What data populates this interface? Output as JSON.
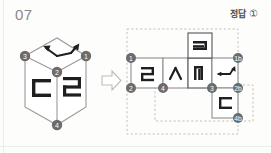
{
  "header": {
    "problem_number": "07",
    "answer_label": "정답",
    "answer_choice": "①"
  },
  "transform_arrow": {
    "icon": "right-arrow-outline-icon",
    "direction": "right"
  },
  "cube": {
    "caption": "cube-isometric-view",
    "faces": [
      {
        "position": "top",
        "symbol": "↖↘↗",
        "symbol_name": "double-bent-arrow",
        "rotation": 0
      },
      {
        "position": "left",
        "symbol": "ㄷ",
        "symbol_name": "hangul-jamo-digeut",
        "rotation": 0
      },
      {
        "position": "right",
        "symbol": "ㄹ",
        "symbol_name": "hangul-jamo-rieul",
        "rotation": 0
      }
    ],
    "vertices": [
      {
        "id": "1",
        "label": "①",
        "x": 86,
        "y": 56
      },
      {
        "id": "2",
        "label": "②",
        "x": 57,
        "y": 72
      },
      {
        "id": "3",
        "label": "③",
        "x": 25,
        "y": 56
      },
      {
        "id": "4",
        "label": "④",
        "x": 57,
        "y": 125
      }
    ]
  },
  "net": {
    "caption": "unfolded-cube-net",
    "cells": [
      {
        "id": "cell-a",
        "symbol": "ㄹ",
        "symbol_name": "hangul-jamo-rieul",
        "col": 0,
        "row": 1
      },
      {
        "id": "cell-b",
        "symbol": "ㅅ",
        "symbol_name": "hangul-jamo-siot",
        "col": 1,
        "row": 1
      },
      {
        "id": "cell-c",
        "symbol": "ㅋ",
        "symbol_name": "hangul-jamo-kieuk",
        "col": 2,
        "row": 0
      },
      {
        "id": "cell-d",
        "symbol": "ㅋ",
        "symbol_name": "hangul-jamo-kieuk-rotated",
        "col": 2,
        "row": 1
      },
      {
        "id": "cell-e",
        "symbol": "↔↗",
        "symbol_name": "double-bent-arrow",
        "col": 3,
        "row": 1
      },
      {
        "id": "cell-f",
        "symbol": "ㄷ",
        "symbol_name": "hangul-jamo-digeut",
        "col": 3,
        "row": 2
      }
    ],
    "vertices": [
      {
        "id": "1",
        "label": "①",
        "x": 131,
        "y": 58
      },
      {
        "id": "2",
        "label": "②",
        "x": 131,
        "y": 88
      },
      {
        "id": "4",
        "label": "④",
        "x": 163,
        "y": 88
      },
      {
        "id": "3",
        "label": "③",
        "x": 212,
        "y": 88
      },
      {
        "id": "2b",
        "label": "②",
        "x": 238,
        "y": 88
      },
      {
        "id": "1b",
        "label": "①",
        "x": 238,
        "y": 58
      },
      {
        "id": "4b",
        "label": "④",
        "x": 238,
        "y": 118
      }
    ],
    "guide_boxes": [
      {
        "id": "guide-outer",
        "x": 127,
        "y": 29,
        "w": 111,
        "h": 105
      },
      {
        "id": "guide-inner",
        "x": 155,
        "y": 85,
        "w": 98,
        "h": 36
      }
    ]
  },
  "colors": {
    "line": "#4d4d4d",
    "line_light": "#9a9a9a",
    "vertex_fill": "#6b6b6b",
    "vertex_text": "#ffffff",
    "guide_dash": "#c4b8b0",
    "text": "#4b4b4b",
    "problem_number": "#8a8a8a",
    "page_bg": "#fdfdfc"
  }
}
